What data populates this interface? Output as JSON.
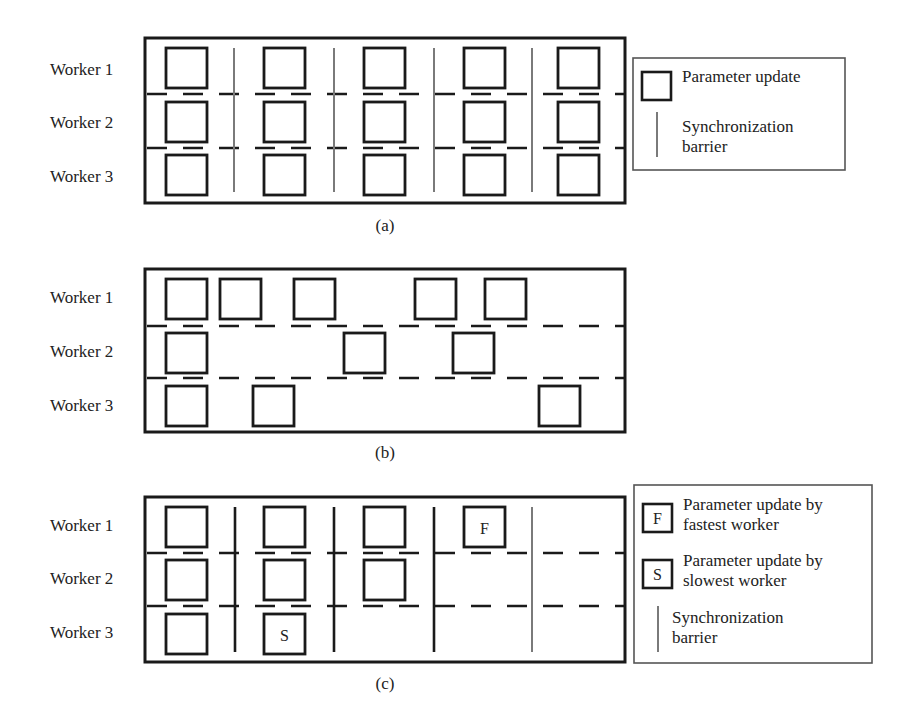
{
  "colors": {
    "frame": "#1a1a1a",
    "square": "#1a1a1a",
    "dash": "#1a1a1a",
    "barrier_gray": "#7a7a7a",
    "barrier_black": "#1a1a1a",
    "legend_border": "#555555"
  },
  "worker_labels": [
    "Worker 1",
    "Worker 2",
    "Worker 3"
  ],
  "panels": [
    {
      "id": "a",
      "caption": "(a)",
      "caption_pos": [
        385,
        216
      ],
      "frame": [
        145,
        38,
        480,
        165
      ],
      "label_ys": [
        60,
        113,
        167
      ],
      "row_ys": [
        48,
        102,
        155
      ],
      "dash_ys": [
        94,
        148
      ],
      "square_size": [
        41,
        40
      ],
      "rows": [
        {
          "worker": "Worker 1",
          "squares": [
            {
              "x": 166
            },
            {
              "x": 264
            },
            {
              "x": 364
            },
            {
              "x": 464
            },
            {
              "x": 558
            }
          ]
        },
        {
          "worker": "Worker 2",
          "squares": [
            {
              "x": 166
            },
            {
              "x": 264
            },
            {
              "x": 364
            },
            {
              "x": 464
            },
            {
              "x": 558
            }
          ]
        },
        {
          "worker": "Worker 3",
          "squares": [
            {
              "x": 166
            },
            {
              "x": 264
            },
            {
              "x": 364
            },
            {
              "x": 464
            },
            {
              "x": 558
            }
          ]
        }
      ],
      "barriers": [
        {
          "x": 234,
          "style": "gray"
        },
        {
          "x": 334,
          "style": "gray"
        },
        {
          "x": 434,
          "style": "gray"
        },
        {
          "x": 532,
          "style": "gray"
        }
      ],
      "barrier_span": [
        48,
        192
      ]
    },
    {
      "id": "b",
      "caption": "(b)",
      "caption_pos": [
        385,
        443
      ],
      "frame": [
        145,
        269,
        480,
        163
      ],
      "label_ys": [
        288,
        342,
        396
      ],
      "row_ys": [
        279,
        333,
        386
      ],
      "dash_ys": [
        326,
        378
      ],
      "square_size": [
        41,
        40
      ],
      "rows": [
        {
          "worker": "Worker 1",
          "squares": [
            {
              "x": 166
            },
            {
              "x": 220
            },
            {
              "x": 294
            },
            {
              "x": 415
            },
            {
              "x": 485
            }
          ]
        },
        {
          "worker": "Worker 2",
          "squares": [
            {
              "x": 166
            },
            {
              "x": 344
            },
            {
              "x": 453
            }
          ]
        },
        {
          "worker": "Worker 3",
          "squares": [
            {
              "x": 166
            },
            {
              "x": 253
            },
            {
              "x": 539
            }
          ]
        }
      ],
      "barriers": [],
      "barrier_span": [
        0,
        0
      ]
    },
    {
      "id": "c",
      "caption": "(c)",
      "caption_pos": [
        385,
        674
      ],
      "frame": [
        145,
        497,
        480,
        165
      ],
      "label_ys": [
        516,
        569,
        623
      ],
      "row_ys": [
        507,
        560,
        614
      ],
      "dash_ys": [
        553,
        606
      ],
      "square_size": [
        41,
        40
      ],
      "rows": [
        {
          "worker": "Worker 1",
          "squares": [
            {
              "x": 166
            },
            {
              "x": 264
            },
            {
              "x": 364
            },
            {
              "x": 464,
              "letter": "F"
            }
          ]
        },
        {
          "worker": "Worker 2",
          "squares": [
            {
              "x": 166
            },
            {
              "x": 264
            },
            {
              "x": 364
            }
          ]
        },
        {
          "worker": "Worker 3",
          "squares": [
            {
              "x": 166
            },
            {
              "x": 264,
              "letter": "S"
            }
          ]
        }
      ],
      "barriers": [
        {
          "x": 235,
          "style": "black"
        },
        {
          "x": 334,
          "style": "black"
        },
        {
          "x": 434,
          "style": "black"
        },
        {
          "x": 532,
          "style": "gray"
        }
      ],
      "barrier_span": [
        507,
        652
      ]
    }
  ],
  "legends": [
    {
      "id": "legend-a",
      "box": [
        633,
        58,
        212,
        112
      ],
      "items": [
        {
          "type": "square",
          "icon_box": [
            642,
            72,
            29,
            28
          ],
          "text_lines": [
            "Parameter update"
          ],
          "text_pos": [
            682,
            68
          ]
        },
        {
          "type": "barrier",
          "line": [
            657,
            112,
            157
          ],
          "text_lines": [
            "Synchronization",
            "barrier"
          ],
          "text_pos": [
            682,
            118
          ]
        }
      ]
    },
    {
      "id": "legend-c",
      "box": [
        634,
        485,
        238,
        178
      ],
      "items": [
        {
          "type": "square",
          "letter": "F",
          "icon_box": [
            643,
            504,
            29,
            28
          ],
          "text_lines": [
            "Parameter update by",
            "fastest worker"
          ],
          "text_pos": [
            683,
            496
          ]
        },
        {
          "type": "square",
          "letter": "S",
          "icon_box": [
            643,
            560,
            29,
            28
          ],
          "text_lines": [
            "Parameter update by",
            "slowest worker"
          ],
          "text_pos": [
            683,
            552
          ]
        },
        {
          "type": "barrier",
          "line": [
            658,
            606,
            652
          ],
          "text_lines": [
            "Synchronization",
            "barrier"
          ],
          "text_pos": [
            672,
            609
          ]
        }
      ]
    }
  ],
  "dash_pattern": {
    "length": 20,
    "gap": 16
  }
}
